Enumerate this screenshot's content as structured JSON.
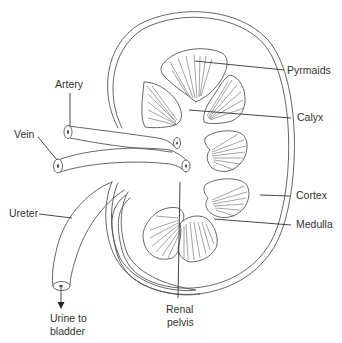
{
  "diagram": {
    "labels": {
      "artery": "Artery",
      "vein": "Vein",
      "ureter": "Ureter",
      "urine_line1": "Urine to",
      "urine_line2": "bladder",
      "pyramids": "Pyrmaids",
      "calyx": "Calyx",
      "cortex": "Cortex",
      "medulla": "Medulla",
      "renal_line1": "Renal",
      "renal_line2": "pelvis"
    },
    "colors": {
      "line": "#555555",
      "text": "#333333",
      "background": "#ffffff"
    }
  }
}
